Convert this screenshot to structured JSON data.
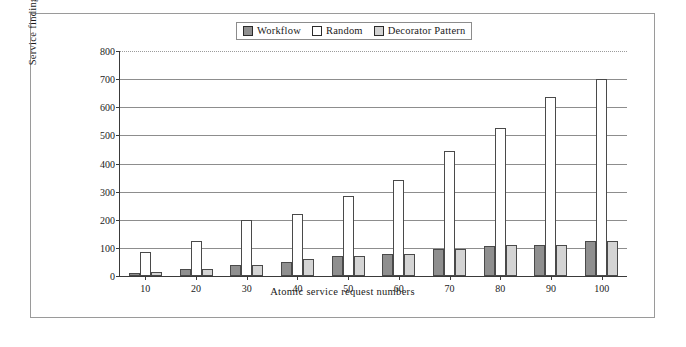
{
  "chart_data": {
    "type": "bar",
    "title": "",
    "xlabel": "Atomic service request numbers",
    "ylabel": "Service finding time (s)",
    "categories": [
      "10",
      "20",
      "30",
      "40",
      "50",
      "60",
      "70",
      "80",
      "90",
      "100"
    ],
    "ylim": [
      0,
      800
    ],
    "yticks": [
      "0",
      "100",
      "200",
      "300",
      "400",
      "500",
      "600",
      "700",
      "800"
    ],
    "grid": true,
    "legend_position": "top-center",
    "series": [
      {
        "name": "Workflow",
        "color": "#8f8f8f",
        "values": [
          10,
          25,
          40,
          50,
          70,
          80,
          95,
          105,
          112,
          125
        ]
      },
      {
        "name": "Random",
        "color": "#ffffff",
        "values": [
          85,
          125,
          198,
          220,
          285,
          340,
          445,
          525,
          635,
          700
        ]
      },
      {
        "name": "Decorator Pattern",
        "color": "#d4d4d4",
        "values": [
          15,
          25,
          38,
          60,
          72,
          80,
          95,
          110,
          112,
          125
        ]
      }
    ]
  },
  "legend": {
    "items": [
      {
        "label": "Workflow"
      },
      {
        "label": "Random"
      },
      {
        "label": "Decorator Pattern"
      }
    ]
  }
}
